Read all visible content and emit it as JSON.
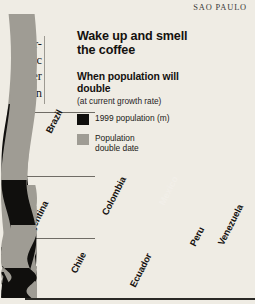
{
  "page": {
    "dateline": "SAO PAULO",
    "background_color": "#efece4",
    "body_fragments": [
      "mer-",
      "omic",
      "nder",
      "main"
    ]
  },
  "headline": "Wake up and smell the coffee",
  "subhead": "When population will double",
  "subnote": "(at current growth rate)",
  "legend": {
    "population": {
      "label": "1999 population (m)",
      "color": "#100f0d"
    },
    "double_date": {
      "label": "Population\ndouble date",
      "color": "#9f9c94"
    }
  },
  "axis": {
    "ticks": [
      "150",
      "100",
      "50",
      "0"
    ],
    "tick_values": [
      150,
      100,
      50,
      0
    ],
    "ylim": [
      0,
      185
    ],
    "ylabel": ""
  },
  "chart_data": {
    "type": "bar",
    "title": "Wake up and smell the coffee",
    "subtitle": "When population will double (at current growth rate)",
    "xlabel": "",
    "ylabel": "1999 population (m)",
    "ylim": [
      0,
      185
    ],
    "grid": true,
    "legend": [
      "1999 population (m)",
      "Population double date"
    ],
    "legend_position": "top-left",
    "categories": [
      "Brazil",
      "Argentina",
      "Chile",
      "Colombia",
      "Ecuador",
      "Mexico",
      "Peru",
      "Venezuela"
    ],
    "series": [
      {
        "name": "1999 population (m)",
        "values": [
          168,
          37,
          15,
          42,
          12,
          97,
          25,
          24
        ]
      },
      {
        "name": "Population double date",
        "values": [
          null,
          2049,
          2045,
          2036,
          2030,
          2037,
          2034,
          2029
        ]
      }
    ],
    "annotations": [
      {
        "country": "Brazil",
        "double_date": ""
      },
      {
        "country": "Argentina",
        "double_date": "2049"
      },
      {
        "country": "Chile",
        "double_date": "2045"
      },
      {
        "country": "Colombia",
        "double_date": "2036"
      },
      {
        "country": "Ecuador",
        "double_date": "2030"
      },
      {
        "country": "Mexico",
        "double_date": "2037"
      },
      {
        "country": "Peru",
        "double_date": "2034"
      },
      {
        "country": "Venezuela",
        "double_date": "2029"
      }
    ]
  },
  "bars": [
    {
      "name": "Brazil",
      "label": "Brazil",
      "date": "",
      "left": 47,
      "width": 26,
      "gray_top": 14,
      "black_top": 104,
      "label_bottom": 124,
      "label_left": 6,
      "label_on_black": false,
      "date_top": 0,
      "date_left": 0
    },
    {
      "name": "Argentina",
      "label": "Argentina",
      "date": "2049",
      "left": 27,
      "width": 26,
      "gray_top": 185,
      "black_top": 247,
      "label_bottom": 231,
      "label_left": 4,
      "label_on_black": false,
      "date_top": 216,
      "date_left": 3
    },
    {
      "name": "Chile",
      "label": "Chile",
      "date": "2045",
      "left": 73,
      "width": 26,
      "gray_top": 243,
      "black_top": 272,
      "label_bottom": 264,
      "label_left": 5,
      "label_on_black": false,
      "date_top": 252,
      "date_left": 3
    },
    {
      "name": "Colombia",
      "label": "Colombia",
      "date": "2036",
      "left": 105,
      "width": 26,
      "gray_top": 206,
      "black_top": 254,
      "label_bottom": 206,
      "label_left": 4,
      "label_on_black": false,
      "date_top": 221,
      "date_left": 3
    },
    {
      "name": "Ecuador",
      "label": "Ecuador",
      "date": "2030",
      "left": 133,
      "width": 26,
      "gray_top": 266,
      "black_top": 283,
      "label_bottom": 278,
      "label_left": 4,
      "label_on_black": false,
      "date_top": 273,
      "date_left": 3
    },
    {
      "name": "Mexico",
      "label": "Mexico",
      "date": "2037",
      "left": 162,
      "width": 26,
      "gray_top": 79,
      "black_top": 180,
      "label_bottom": 196,
      "label_left": 4,
      "label_on_black": true,
      "date_top": 81,
      "date_left": 3
    },
    {
      "name": "Peru",
      "label": "Peru",
      "date": "2034",
      "left": 192,
      "width": 26,
      "gray_top": 230,
      "black_top": 266,
      "label_bottom": 237,
      "label_left": 5,
      "label_on_black": false,
      "date_top": 238,
      "date_left": 3
    },
    {
      "name": "Venezuela",
      "label": "Venezuela",
      "date": "2029",
      "left": 221,
      "width": 26,
      "gray_top": 225,
      "black_top": 268,
      "label_bottom": 236,
      "label_left": 4,
      "label_on_black": false,
      "date_top": 232,
      "date_left": 3
    }
  ]
}
